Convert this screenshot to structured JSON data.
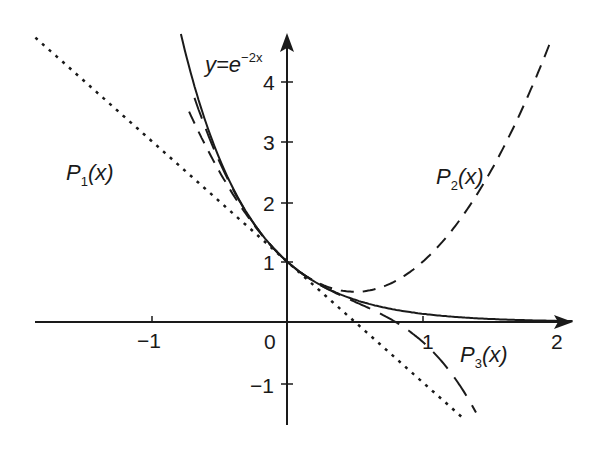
{
  "chart_data": {
    "type": "line",
    "title": "",
    "xlabel": "",
    "ylabel": "",
    "xlim": [
      -2.1,
      2.1
    ],
    "ylim": [
      -1.7,
      4.8
    ],
    "grid": false,
    "x_ticks": [
      "-1",
      "0",
      "1",
      "2"
    ],
    "y_ticks": [
      "-1",
      "1",
      "2",
      "3",
      "4"
    ],
    "annotations": [
      {
        "text": "y=e^{-2x}",
        "at": [
          -0.55,
          4.5
        ]
      },
      {
        "text": "P1(x)",
        "at": [
          -1.65,
          2.5
        ]
      },
      {
        "text": "P2(x)",
        "at": [
          1.25,
          2.5
        ]
      },
      {
        "text": "P3(x)",
        "at": [
          1.3,
          -0.55
        ]
      }
    ],
    "series": [
      {
        "name": "y=e^{-2x}",
        "style": "solid",
        "formula": "exp(-2x)",
        "x": [
          -0.75,
          -0.5,
          -0.25,
          0,
          0.25,
          0.5,
          0.75,
          1.0,
          1.25,
          1.5,
          2.0
        ],
        "values": [
          4.48,
          2.72,
          1.65,
          1.0,
          0.61,
          0.37,
          0.22,
          0.14,
          0.08,
          0.05,
          0.02
        ]
      },
      {
        "name": "P1(x)",
        "style": "dotted",
        "formula": "1-2x",
        "x": [
          -1.85,
          -1,
          0,
          1,
          1.29
        ],
        "values": [
          4.7,
          3.0,
          1.0,
          -1.0,
          -1.58
        ]
      },
      {
        "name": "P2(x)",
        "style": "short-dash",
        "formula": "1-2x+2x^2",
        "x": [
          -0.7,
          -0.5,
          0,
          0.5,
          1.0,
          1.5,
          1.93
        ],
        "values": [
          3.38,
          2.5,
          1.0,
          0.5,
          1.0,
          2.5,
          4.59
        ]
      },
      {
        "name": "P3(x)",
        "style": "long-dash",
        "formula": "1-2x+2x^2-(4/3)x^3",
        "x": [
          -0.65,
          -0.5,
          0,
          0.5,
          1.0,
          1.38
        ],
        "values": [
          3.51,
          2.67,
          1.0,
          0.33,
          -0.33,
          -1.45
        ]
      }
    ]
  },
  "labels": {
    "func_y": "y=e",
    "func_exp": "−2x",
    "p1_main": "P",
    "p1_sub": "1",
    "p1_tail": "(x)",
    "p2_main": "P",
    "p2_sub": "2",
    "p2_tail": "(x)",
    "p3_main": "P",
    "p3_sub": "3",
    "p3_tail": "(x)",
    "x_tick_m1": "−1",
    "x_tick_0": "0",
    "x_tick_1": "1",
    "x_tick_2": "2",
    "y_tick_m1": "−1",
    "y_tick_1": "1",
    "y_tick_2": "2",
    "y_tick_3": "3",
    "y_tick_4": "4"
  }
}
